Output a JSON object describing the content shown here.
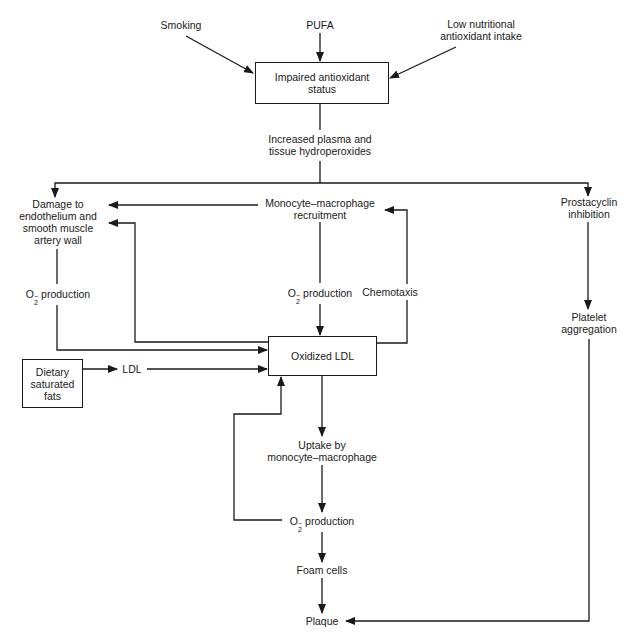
{
  "diagram": {
    "nodes": {
      "smoking": "Smoking",
      "pufa": "PUFA",
      "low_antioxidant": [
        "Low nutritional",
        "antioxidant intake"
      ],
      "impaired_status": [
        "Impaired antioxidant",
        "status"
      ],
      "hydroperoxides": [
        "Increased plasma and",
        "tissue hydroperoxides"
      ],
      "damage": [
        "Damage to",
        "endothelium and",
        "smooth muscle",
        "artery wall"
      ],
      "monocyte_recruitment": [
        "Monocyte–macrophage",
        "recruitment"
      ],
      "prostacyclin": [
        "Prostacyclin",
        "inhibition"
      ],
      "o2_left": {
        "symbol": "O",
        "sub": "2",
        "sup": "−",
        "text": "production"
      },
      "o2_center": {
        "symbol": "O",
        "sub": "2",
        "sup": "−",
        "text": "production"
      },
      "chemotaxis": "Chemotaxis",
      "platelet": [
        "Platelet",
        "aggregation"
      ],
      "oxidized_ldl": "Oxidized LDL",
      "dietary_fats": [
        "Dietary",
        "saturated",
        "fats"
      ],
      "ldl": "LDL",
      "uptake": [
        "Uptake by",
        "monocyte–macrophage"
      ],
      "o2_bottom": {
        "symbol": "O",
        "sub": "2",
        "sup": "−",
        "text": "production"
      },
      "foam_cells": "Foam cells",
      "plaque": "Plaque"
    },
    "edges": [
      {
        "from": "Smoking",
        "to": "Impaired antioxidant status"
      },
      {
        "from": "PUFA",
        "to": "Impaired antioxidant status"
      },
      {
        "from": "Low nutritional antioxidant intake",
        "to": "Impaired antioxidant status"
      },
      {
        "from": "Impaired antioxidant status",
        "to": "Increased plasma and tissue hydroperoxides"
      },
      {
        "from": "Increased plasma and tissue hydroperoxides",
        "to": "Damage to endothelium and smooth muscle artery wall"
      },
      {
        "from": "Increased plasma and tissue hydroperoxides",
        "to": "Prostacyclin inhibition"
      },
      {
        "from": "Monocyte–macrophage recruitment",
        "to": "Damage to endothelium and smooth muscle artery wall"
      },
      {
        "from": "Oxidized LDL",
        "to": "Damage to endothelium and smooth muscle artery wall"
      },
      {
        "from": "Damage to endothelium and smooth muscle artery wall",
        "to": "Oxidized LDL",
        "label": "O2− production"
      },
      {
        "from": "Monocyte–macrophage recruitment",
        "to": "Oxidized LDL",
        "label": "O2− production"
      },
      {
        "from": "Oxidized LDL",
        "to": "Monocyte–macrophage recruitment",
        "label": "Chemotaxis"
      },
      {
        "from": "Dietary saturated fats",
        "to": "LDL"
      },
      {
        "from": "LDL",
        "to": "Oxidized LDL"
      },
      {
        "from": "Oxidized LDL",
        "to": "Uptake by monocyte–macrophage"
      },
      {
        "from": "Uptake by monocyte–macrophage",
        "to": "O2− production"
      },
      {
        "from": "O2− production",
        "to": "Oxidized LDL"
      },
      {
        "from": "O2− production",
        "to": "Foam cells"
      },
      {
        "from": "Foam cells",
        "to": "Plaque"
      },
      {
        "from": "Prostacyclin inhibition",
        "to": "Platelet aggregation"
      },
      {
        "from": "Platelet aggregation",
        "to": "Plaque"
      }
    ],
    "colors": {
      "line": "#1a1a1a",
      "background": "#ffffff"
    }
  }
}
